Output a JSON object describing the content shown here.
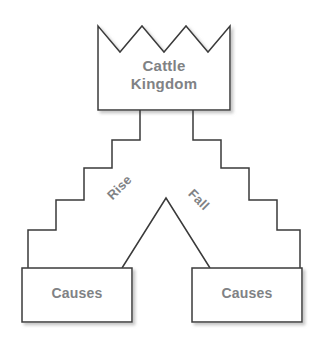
{
  "diagram": {
    "type": "hierarchy-cause-diagram",
    "background_color": "#ffffff",
    "stroke_color": "#3a3a3a",
    "text_color": "#808285",
    "shape_fill": "#ffffff",
    "nodes": {
      "crown": {
        "label": "Cattle\nKingdom",
        "shape": "crown"
      },
      "causes_left": {
        "label": "Causes",
        "shape": "rectangle"
      },
      "causes_right": {
        "label": "Causes",
        "shape": "rectangle"
      }
    },
    "edges": {
      "rise": {
        "label": "Rise",
        "rotation_deg": -45
      },
      "fall": {
        "label": "Fall",
        "rotation_deg": 45
      }
    }
  }
}
